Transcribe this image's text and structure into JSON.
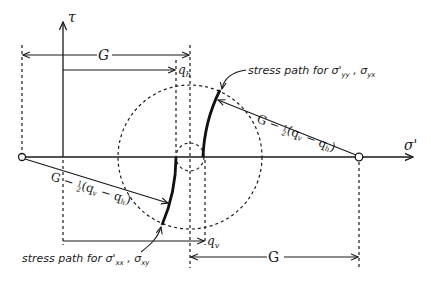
{
  "diagram": {
    "type": "mohr-circle-stress-path",
    "axes": {
      "horizontal_label": "σ'",
      "vertical_label": "τ"
    },
    "dimensions": {
      "top_G": "G",
      "q_h": "q",
      "q_h_sub": "h",
      "q_v": "q",
      "q_v_sub": "v",
      "bottom_G": "G"
    },
    "radius_labels": {
      "upper": {
        "main": "G − ",
        "frac_num": "1",
        "frac_den": "2",
        "paren": "(q",
        "sub1": "v",
        "minus": " − q",
        "sub2": "h",
        "close": ")"
      },
      "lower": {
        "main": "G − ",
        "frac_num": "1",
        "frac_den": "2",
        "paren": "(q",
        "sub1": "v",
        "minus": " − q",
        "sub2": "h",
        "close": ")"
      }
    },
    "annotations": {
      "upper_path": {
        "prefix": "stress path for ",
        "sym1": "σ'",
        "sub1": "yy",
        "sep": " , ",
        "sym2": "σ",
        "sub2": "yx"
      },
      "lower_path": {
        "prefix": "stress path for ",
        "sym1": "σ'",
        "sub1": "xx",
        "sep": " , ",
        "sym2": "σ",
        "sub2": "xy"
      }
    },
    "colors": {
      "ink": "#1a1a1a",
      "background": "#ffffff"
    }
  }
}
